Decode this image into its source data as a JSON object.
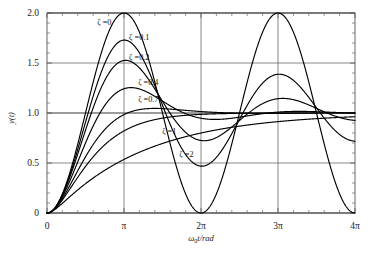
{
  "chart_data": {
    "type": "line",
    "title": "",
    "subtitle": "",
    "xlabel": "ω₀t/rad",
    "ylabel": "y(t)",
    "xlim": [
      0,
      12.566370614359172
    ],
    "ylim": [
      0,
      2.0
    ],
    "grid": true,
    "legend_position": "inline-annotations",
    "x_tick_labels": [
      "0",
      "π",
      "2π",
      "3π",
      "4π"
    ],
    "x_tick_values": [
      0,
      3.141592653589793,
      6.283185307179586,
      9.42477796076938,
      12.566370614359172
    ],
    "y_tick_labels": [
      "0",
      "0.5",
      "1.0",
      "1.5",
      "2.0"
    ],
    "y_tick_values": [
      0,
      0.5,
      1.0,
      1.5,
      2.0
    ],
    "x_minor_ticks_per_major": 4,
    "y_minor_ticks_per_major": 4,
    "series": [
      {
        "name": "ζ =0",
        "zeta": 0,
        "annotation": "ζ =0",
        "annotation_x": 2.05,
        "annotation_y": 1.88,
        "peak_value": 2.0,
        "peak_x": 3.141592653589793,
        "second_peak_value": 2.0,
        "second_peak_x": 9.42477796076938,
        "min_value": 0.0,
        "min_x": 6.283185307179586,
        "final_value": 1.0
      },
      {
        "name": "ζ =0.1",
        "zeta": 0.1,
        "annotation": "ζ =0.1",
        "annotation_x": 3.35,
        "annotation_y": 1.73,
        "peak_value": 1.73,
        "peak_x": 3.157,
        "second_peak_value": 1.38,
        "second_peak_x": 9.47,
        "min_value": 0.47,
        "min_x": 6.315,
        "final_value": 1.0
      },
      {
        "name": "ζ =0.2",
        "zeta": 0.2,
        "annotation": "ζ =0.2",
        "annotation_x": 3.35,
        "annotation_y": 1.53,
        "peak_value": 1.53,
        "peak_x": 3.206,
        "second_peak_value": 1.14,
        "second_peak_x": 9.62,
        "min_value": 0.73,
        "min_x": 6.41,
        "final_value": 1.0
      },
      {
        "name": "ζ =0.4",
        "zeta": 0.4,
        "annotation": "ζ =0.4",
        "annotation_x": 3.72,
        "annotation_y": 1.28,
        "peak_value": 1.25,
        "peak_x": 3.43,
        "second_peak_value": 1.03,
        "second_peak_x": 10.28,
        "min_value": 0.94,
        "min_x": 6.86,
        "final_value": 1.0
      },
      {
        "name": "ζ =0.7",
        "zeta": 0.7,
        "annotation": "ζ =0.7",
        "annotation_x": 3.72,
        "annotation_y": 1.11,
        "peak_value": 1.046,
        "peak_x": 4.4,
        "second_peak_value": 1.0,
        "second_peak_x": 13.2,
        "min_value": 0.998,
        "min_x": 8.8,
        "final_value": 1.0
      },
      {
        "name": "ζ =1",
        "zeta": 1,
        "annotation": "ζ =1",
        "annotation_x": 4.7,
        "annotation_y": 0.79,
        "peak_value": 1.0,
        "peak_x": 12.566370614359172,
        "second_peak_value": 1.0,
        "second_peak_x": 12.566370614359172,
        "min_value": 0.0,
        "min_x": 0,
        "final_value": 1.0
      },
      {
        "name": "ζ =2",
        "zeta": 2,
        "annotation": "ζ =2",
        "annotation_x": 5.4,
        "annotation_y": 0.56,
        "peak_value": 0.93,
        "peak_x": 12.566370614359172,
        "second_peak_value": 0.93,
        "second_peak_x": 12.566370614359172,
        "min_value": 0.0,
        "min_x": 0,
        "final_value": 1.0
      }
    ]
  },
  "figure": {
    "x_axis_label_parts": {
      "omega": "ω",
      "subscript": "0",
      "rest": "t/rad"
    },
    "y_axis_label_parts": {
      "y": "y",
      "paren": "(t)"
    },
    "curve_color": "#000000",
    "grid_color": "#6b6b6b",
    "axis_color": "#555555",
    "background": "#ffffff"
  }
}
